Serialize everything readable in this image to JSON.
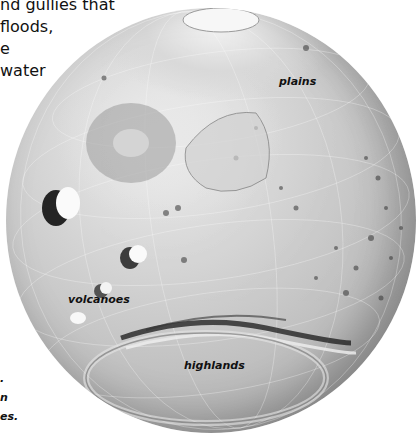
{
  "body_text": {
    "lines": [
      "nd gullies that",
      "floods,",
      "e",
      "water"
    ]
  },
  "caption": {
    "lines": [
      ".",
      "n",
      "es."
    ]
  },
  "globe": {
    "subject": "Mars globe relief map",
    "labels": {
      "plains": "plains",
      "volcanoes": "volcanoes",
      "highlands": "highlands"
    }
  }
}
